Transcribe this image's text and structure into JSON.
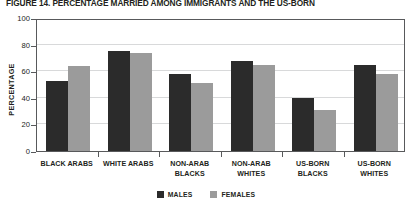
{
  "chart_data": {
    "type": "bar",
    "title": "FIGURE 14. PERCENTAGE MARRIED AMONG IMMIGRANTS AND THE US-BORN",
    "xlabel": "",
    "ylabel": "PERCENTAGE",
    "ylim": [
      0,
      100
    ],
    "yticks": [
      0,
      20,
      40,
      60,
      80,
      100
    ],
    "ytick_labels": [
      "0",
      "20",
      "40",
      "60",
      "80",
      "100"
    ],
    "grid": true,
    "legend_position": "bottom-center",
    "categories": [
      "BLACK ARABS",
      "WHITE ARABS",
      "NON-ARAB BLACKS",
      "NON-ARAB WHITES",
      "US-BORN BLACKS",
      "US-BORN WHITES"
    ],
    "category_lines": [
      [
        "BLACK ARABS"
      ],
      [
        "WHITE ARABS"
      ],
      [
        "NON-ARAB",
        "BLACKS"
      ],
      [
        "NON-ARAB",
        "WHITES"
      ],
      [
        "US-BORN",
        "BLACKS"
      ],
      [
        "US-BORN",
        "WHITES"
      ]
    ],
    "series": [
      {
        "name": "MALES",
        "color": "#2b2b2b",
        "values": [
          53,
          75,
          58,
          68,
          40,
          65
        ]
      },
      {
        "name": "FEMALES",
        "color": "#9b9b9b",
        "values": [
          64,
          74,
          51,
          65,
          31,
          58
        ]
      }
    ]
  },
  "legend": {
    "items": [
      {
        "label": "MALES",
        "color": "#2b2b2b"
      },
      {
        "label": "FEMALES",
        "color": "#9b9b9b"
      }
    ]
  },
  "colors": {
    "males": "#2b2b2b",
    "females": "#9b9b9b",
    "axis": "#58595b",
    "grid": "#d8d9da",
    "text": "#231f20",
    "background": "#ffffff"
  }
}
